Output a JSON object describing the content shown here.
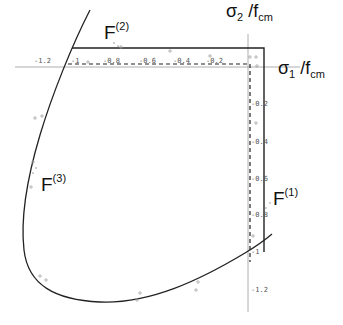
{
  "diagram": {
    "axes": {
      "x_label": {
        "main": "σ",
        "sub1": "1",
        "sep": " /f",
        "sub2": "cm"
      },
      "y_label": {
        "main": "σ",
        "sub1": "2",
        "sep": " /f",
        "sub2": "cm"
      },
      "x_ticks": [
        "-1.2",
        "-1",
        "-0.8",
        "-0.6",
        "-0.4",
        "-0.2"
      ],
      "y_ticks": [
        "-0.2",
        "-0.4",
        "-0.6",
        "-0.8",
        "-1",
        "-1.2"
      ]
    },
    "failure_labels": [
      {
        "id": "F1",
        "main": "F",
        "sup": "(1)"
      },
      {
        "id": "F2",
        "main": "F",
        "sup": "(2)"
      },
      {
        "id": "F3",
        "main": "F",
        "sup": "(3)"
      }
    ],
    "elements": {
      "curve": "failure-envelope-curve",
      "solid_box": "solid-limit-lines",
      "dashed_box": "dashed-limit-lines",
      "points": "experimental-data-points"
    },
    "colors": {
      "line": "#222222",
      "axis": "#888888",
      "points": "#999999",
      "text": "#111111"
    }
  }
}
